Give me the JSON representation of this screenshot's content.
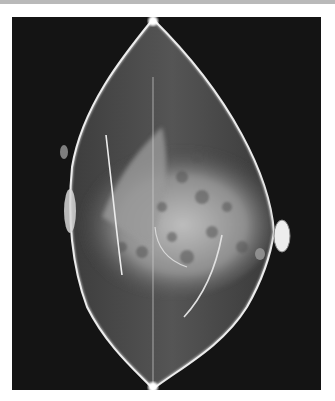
{
  "image": {
    "kind": "mammogram",
    "description": "Grayscale X-ray mammography image of a breast on a black background, with curved surgical/marker lines visible over dense fibroglandular tissue and skin markers at left and right edges.",
    "colors": {
      "background": "#141414",
      "tissue": "#a8a8a8",
      "bright": "#f2f2f2",
      "frame": "#ffffff",
      "top_bar": "#b9b9b9"
    }
  }
}
